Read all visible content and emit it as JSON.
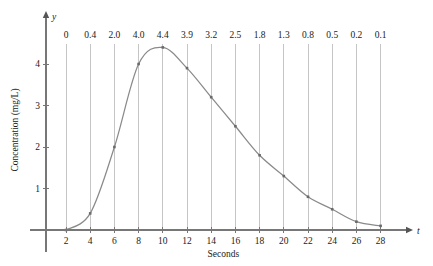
{
  "chart_data": {
    "type": "line",
    "title": "",
    "xlabel": "Seconds",
    "ylabel": "Concentration (mg/L)",
    "x_axis_name": "t",
    "y_axis_name": "y",
    "x": [
      2,
      4,
      6,
      8,
      10,
      12,
      14,
      16,
      18,
      20,
      22,
      24,
      26,
      28
    ],
    "values": [
      0,
      0.4,
      2.0,
      4.0,
      4.4,
      3.9,
      3.2,
      2.5,
      1.8,
      1.3,
      0.8,
      0.5,
      0.2,
      0.1
    ],
    "point_labels": [
      "0",
      "0.4",
      "2.0",
      "4.0",
      "4.4",
      "3.9",
      "3.2",
      "2.5",
      "1.8",
      "1.3",
      "0.8",
      "0.5",
      "0.2",
      "0.1"
    ],
    "xticks": [
      2,
      4,
      6,
      8,
      10,
      12,
      14,
      16,
      18,
      20,
      22,
      24,
      26,
      28
    ],
    "xtick_labels": [
      "2",
      "4",
      "6",
      "8",
      "10",
      "12",
      "14",
      "16",
      "18",
      "20",
      "22",
      "24",
      "26",
      "28"
    ],
    "yticks": [
      1,
      2,
      3,
      4
    ],
    "ytick_labels": [
      "1",
      "2",
      "3",
      "4"
    ],
    "xlim": [
      0,
      30
    ],
    "ylim": [
      0,
      4.8
    ],
    "grid": true,
    "grid_orientation": "vertical",
    "legend": null,
    "series_color": "#8a8a8a",
    "grid_color": "#bfbfbf",
    "axis_color": "#777777",
    "marker": "square",
    "value_labels_position": "top"
  }
}
